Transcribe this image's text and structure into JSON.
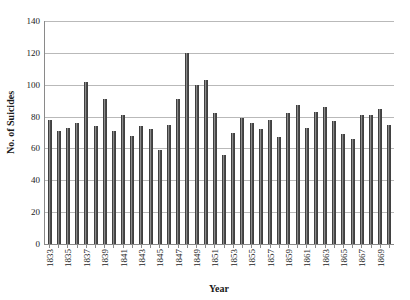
{
  "chart_data": {
    "type": "bar",
    "title": "",
    "xlabel": "Year",
    "ylabel": "No. of Suicides",
    "ylim": [
      0,
      140
    ],
    "ytick_step": 20,
    "yticks": [
      0,
      20,
      40,
      60,
      80,
      100,
      120,
      140
    ],
    "grid": true,
    "legend": "none",
    "bar_color": "#4d4d4d",
    "gridline_color": "#b9b9b9",
    "axis_color": "#8a8a8a",
    "xtick_label_rotation": -90,
    "xtick_label_interval": 2,
    "categories": [
      "1833",
      "1834",
      "1835",
      "1836",
      "1837",
      "1838",
      "1839",
      "1840",
      "1841",
      "1842",
      "1843",
      "1844",
      "1845",
      "1846",
      "1847",
      "1848",
      "1849",
      "1850",
      "1851",
      "1852",
      "1853",
      "1854",
      "1855",
      "1856",
      "1857",
      "1858",
      "1859",
      "1860",
      "1861",
      "1862",
      "1863",
      "1864",
      "1865",
      "1866",
      "1867",
      "1868",
      "1869",
      "1870"
    ],
    "values": [
      78,
      71,
      73,
      76,
      102,
      74,
      91,
      71,
      81,
      68,
      74,
      72,
      59,
      75,
      91,
      120,
      100,
      103,
      82,
      56,
      70,
      79,
      76,
      72,
      78,
      67,
      82,
      87,
      73,
      83,
      86,
      77,
      69,
      66,
      81,
      81,
      85,
      75
    ],
    "xtick_labels_shown": [
      "1833",
      "1835",
      "1837",
      "1839",
      "1841",
      "1843",
      "1845",
      "1847",
      "1849",
      "1851",
      "1853",
      "1855",
      "1857",
      "1859",
      "1861",
      "1863",
      "1865",
      "1867",
      "1869"
    ]
  }
}
